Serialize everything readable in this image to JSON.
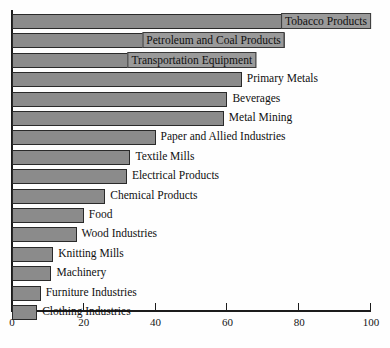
{
  "chart_data": {
    "type": "bar",
    "orientation": "horizontal",
    "title": "",
    "subtitle": "",
    "xlabel": "",
    "ylabel": "",
    "xlim": [
      0,
      100
    ],
    "ylim": null,
    "grid": false,
    "legend": null,
    "xticks": [
      0,
      20,
      40,
      60,
      80,
      100
    ],
    "xtick_labels": [
      "0",
      "20",
      "40",
      "60",
      "80",
      "100"
    ],
    "categories": [
      "Tobacco Products",
      "Petroleum and Coal Products",
      "Transportation Equipment",
      "Primary Metals",
      "Beverages",
      "Metal Mining",
      "Paper and Allied Industries",
      "Textile Mills",
      "Electrical Products",
      "Chemical Products",
      "Food",
      "Wood Industries",
      "Knitting Mills",
      "Machinery",
      "Furniture Industries",
      "Clothing Industries"
    ],
    "values": [
      100,
      76,
      68,
      64,
      60,
      59,
      40,
      33,
      32,
      26,
      20,
      18,
      11.5,
      11,
      8,
      7
    ],
    "bar_color": "#8b8b8b",
    "bar_edge_color": "#2a2a2a",
    "axis_color": "#1c1c1c",
    "background_color": "#fefefe",
    "label_placement": [
      "inside",
      "inside",
      "inside",
      "outside",
      "outside",
      "outside",
      "outside",
      "outside",
      "outside",
      "outside",
      "outside",
      "outside",
      "outside",
      "outside",
      "outside",
      "outside"
    ]
  }
}
